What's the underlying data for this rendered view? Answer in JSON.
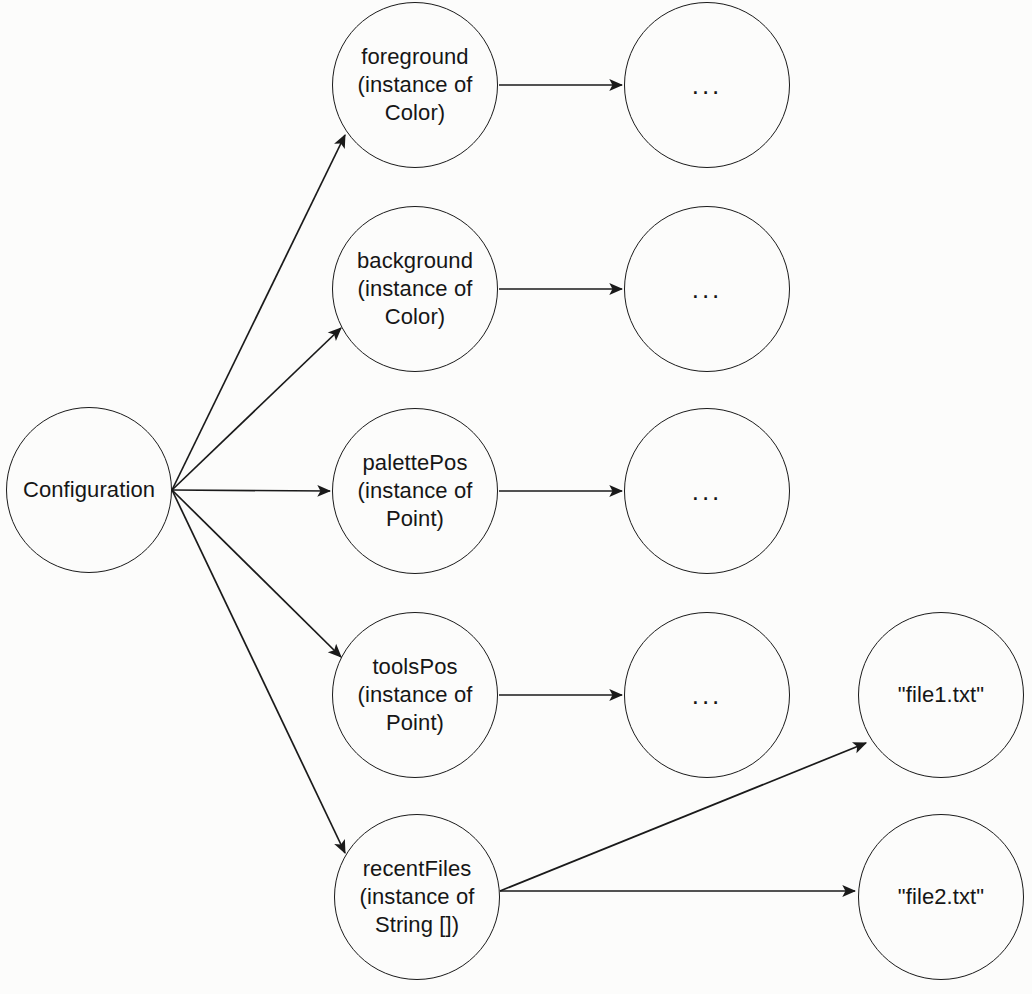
{
  "diagram": {
    "type": "object-reference-diagram",
    "background_color": "#fcfcfb",
    "stroke_color": "#1a1a1a",
    "text_color": "#161616",
    "nodes": [
      {
        "id": "configuration",
        "label": "Configuration",
        "cx": 89,
        "cy": 490,
        "r": 83
      },
      {
        "id": "foreground",
        "label": "foreground\n(instance of\nColor)",
        "cx": 415,
        "cy": 85,
        "r": 83
      },
      {
        "id": "background",
        "label": "background\n(instance of\nColor)",
        "cx": 415,
        "cy": 289,
        "r": 83
      },
      {
        "id": "palettepos",
        "label": "palettePos\n(instance of\nPoint)",
        "cx": 415,
        "cy": 491,
        "r": 83
      },
      {
        "id": "toolspos",
        "label": "toolsPos\n(instance of\nPoint)",
        "cx": 415,
        "cy": 695,
        "r": 83
      },
      {
        "id": "recentfiles",
        "label": "recentFiles\n(instance of\nString [])",
        "cx": 417,
        "cy": 897,
        "r": 83
      },
      {
        "id": "ellipsis-foreground",
        "label": "...",
        "cx": 707,
        "cy": 85,
        "r": 83
      },
      {
        "id": "ellipsis-background",
        "label": "...",
        "cx": 707,
        "cy": 289,
        "r": 83
      },
      {
        "id": "ellipsis-palettepos",
        "label": "...",
        "cx": 707,
        "cy": 491,
        "r": 83
      },
      {
        "id": "ellipsis-toolspos",
        "label": "...",
        "cx": 707,
        "cy": 695,
        "r": 83
      },
      {
        "id": "file1",
        "label": "\"file1.txt\"",
        "cx": 941,
        "cy": 695,
        "r": 83
      },
      {
        "id": "file2",
        "label": "\"file2.txt\"",
        "cx": 941,
        "cy": 897,
        "r": 83
      }
    ],
    "edges": [
      {
        "id": "configuration-to-foreground",
        "from": "Configuration",
        "to": "foreground (instance of Color)"
      },
      {
        "id": "configuration-to-background",
        "from": "Configuration",
        "to": "background (instance of Color)"
      },
      {
        "id": "configuration-to-palettepos",
        "from": "Configuration",
        "to": "palettePos (instance of Point)"
      },
      {
        "id": "configuration-to-toolspos",
        "from": "Configuration",
        "to": "toolsPos (instance of Point)"
      },
      {
        "id": "configuration-to-recentfiles",
        "from": "Configuration",
        "to": "recentFiles (instance of String [])"
      },
      {
        "id": "foreground-to-ellipsis",
        "from": "foreground (instance of Color)",
        "to": "..."
      },
      {
        "id": "background-to-ellipsis",
        "from": "background (instance of Color)",
        "to": "..."
      },
      {
        "id": "palettepos-to-ellipsis",
        "from": "palettePos (instance of Point)",
        "to": "..."
      },
      {
        "id": "toolspos-to-ellipsis",
        "from": "toolsPos (instance of Point)",
        "to": "..."
      },
      {
        "id": "recentfiles-to-file1",
        "from": "recentFiles (instance of String [])",
        "to": "\"file1.txt\""
      },
      {
        "id": "recentfiles-to-file2",
        "from": "recentFiles (instance of String [])",
        "to": "\"file2.txt\""
      }
    ]
  }
}
